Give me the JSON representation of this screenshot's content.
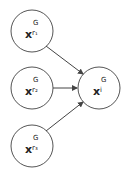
{
  "diagram": {
    "type": "directed-graph",
    "nodes": [
      {
        "id": "r1",
        "base": "x",
        "sup": "G",
        "sub": "r₁",
        "cx": 32,
        "cy": 31
      },
      {
        "id": "r2",
        "base": "x",
        "sup": "G",
        "sub": "r₂",
        "cx": 32,
        "cy": 88
      },
      {
        "id": "r3",
        "base": "x",
        "sup": "G",
        "sub": "r₃",
        "cx": 32,
        "cy": 146
      },
      {
        "id": "i",
        "base": "x",
        "sup": "G",
        "sub": "i",
        "cx": 99,
        "cy": 88
      }
    ],
    "edges": [
      {
        "from": "r1",
        "to": "i"
      },
      {
        "from": "r2",
        "to": "i"
      },
      {
        "from": "r3",
        "to": "i"
      }
    ],
    "colors": {
      "stroke": "#444444",
      "text": "#222222",
      "background": "#ffffff"
    }
  }
}
